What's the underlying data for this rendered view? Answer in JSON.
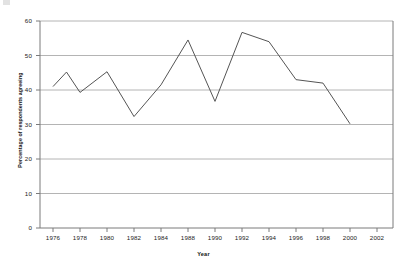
{
  "figure": {
    "background": "#ffffff",
    "line_color": "#555555",
    "grid_color": "#b4b4b4",
    "axis_color": "#7a7a7a"
  },
  "axis_titles": {
    "x": "Year",
    "y": "Percentage of respondents agreeing"
  },
  "chart_data": {
    "type": "line",
    "title": "",
    "xlabel": "Year",
    "ylabel": "Percentage of respondents agreeing",
    "categories": [
      "1976",
      "1978",
      "1980",
      "1982",
      "1984",
      "1988",
      "1990",
      "1992",
      "1994",
      "1996",
      "1998",
      "2000",
      "2002"
    ],
    "x": [
      1976,
      1977,
      1980,
      1982,
      1984,
      1988,
      1990,
      1992,
      1994,
      1996,
      1998,
      2000,
      2002
    ],
    "values": [
      41.0,
      45.2,
      39.3,
      45.3,
      32.3,
      41.5,
      54.5,
      36.7,
      56.7,
      54.0,
      43.0,
      42.0,
      30.2
    ],
    "ylim": [
      0,
      60
    ],
    "yticks": [
      0,
      10,
      20,
      30,
      40,
      50,
      60
    ],
    "ytick_labels": [
      "0",
      "10",
      "20",
      "30",
      "40",
      "50",
      "60"
    ],
    "grid": "horizontal",
    "legend": "none",
    "series": [
      {
        "name": "Percentage of respondents agreeing",
        "values": [
          41.0,
          45.2,
          39.3,
          45.3,
          32.3,
          41.5,
          54.5,
          36.7,
          56.7,
          54.0,
          43.0,
          42.0,
          30.2
        ]
      }
    ]
  }
}
